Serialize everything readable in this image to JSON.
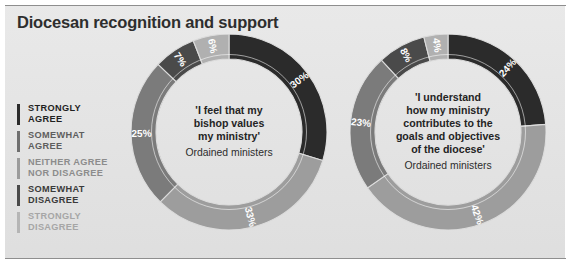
{
  "panel": {
    "title": "Diocesan recognition and support",
    "background_color": "#e6e6e6",
    "rule_color": "#8e8e8e"
  },
  "legend": {
    "items": [
      {
        "label": "STRONGLY\nAGREE",
        "color": "#2b2b2b",
        "text_color": "#1f1f1f"
      },
      {
        "label": "SOMEWHAT\nAGREE",
        "color": "#6e6e6e",
        "text_color": "#5e5e5e"
      },
      {
        "label": "NEITHER AGREE\nNOR DISAGREE",
        "color": "#9b9b9b",
        "text_color": "#8c8c8c"
      },
      {
        "label": "SOMEWHAT\nDISAGREE",
        "color": "#4a4a4a",
        "text_color": "#3a3a3a"
      },
      {
        "label": "STRONGLY\nDISAGREE",
        "color": "#b5b5b5",
        "text_color": "#a6a6a6"
      }
    ]
  },
  "chart_data": [
    {
      "type": "pie",
      "variant": "donut",
      "name": "bishop-values-ministry",
      "title": "'I feel that my bishop values my ministry'",
      "title_lines": [
        "'I feel that my",
        "bishop values",
        "my ministry'"
      ],
      "subtitle": "Ordained ministers",
      "categories": [
        "STRONGLY AGREE",
        "SOMEWHAT AGREE",
        "NEITHER AGREE NOR DISAGREE",
        "SOMEWHAT DISAGREE",
        "STRONGLY DISAGREE"
      ],
      "values": [
        30,
        33,
        25,
        7,
        6
      ],
      "labels": [
        "30%",
        "33%",
        "25%",
        "7%",
        "6%"
      ],
      "colors": [
        "#2b2b2b",
        "#9d9d9d",
        "#7b7b7b",
        "#4a4a4a",
        "#b0b0b0"
      ],
      "units": "percent",
      "legend_position": "left"
    },
    {
      "type": "pie",
      "variant": "donut",
      "name": "ministry-contributes-to-diocese-goals",
      "title": "'I understand how my ministry contributes to the goals and objectives of the diocese'",
      "title_lines": [
        "'I understand",
        "how my ministry",
        "contributes to the",
        "goals and objectives",
        "of the diocese'"
      ],
      "subtitle": "Ordained ministers",
      "categories": [
        "STRONGLY AGREE",
        "SOMEWHAT AGREE",
        "NEITHER AGREE NOR DISAGREE",
        "SOMEWHAT DISAGREE",
        "STRONGLY DISAGREE"
      ],
      "values": [
        24,
        42,
        23,
        8,
        4
      ],
      "labels": [
        "24%",
        "42%",
        "23%",
        "8%",
        "4%"
      ],
      "colors": [
        "#2b2b2b",
        "#9d9d9d",
        "#7b7b7b",
        "#4a4a4a",
        "#b0b0b0"
      ],
      "units": "percent",
      "legend_position": "left"
    }
  ]
}
